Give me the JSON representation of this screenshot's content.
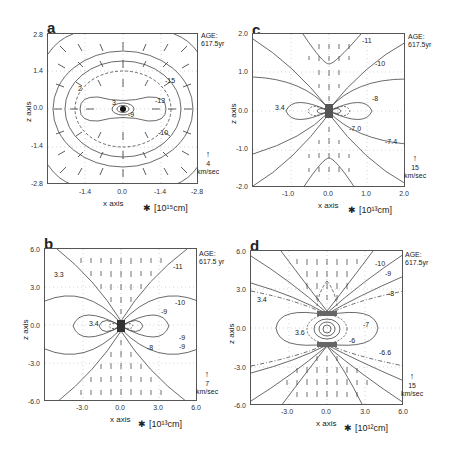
{
  "figure": {
    "panels": [
      {
        "id": "a",
        "letter": "a",
        "age_label": "AGE:",
        "age_value": "617.5yr",
        "y_axis_label": "z axis",
        "x_axis_label": "x axis",
        "unit_star": "✱",
        "unit": "[10¹⁵cm]",
        "y_ticks": [
          "2.8",
          "1.4",
          "0.0",
          "-1.4",
          "-2.8"
        ],
        "x_ticks": [
          "-1.4",
          "0.0",
          "-1.4",
          "-2.8"
        ],
        "velocity_scale_value": "4",
        "velocity_scale_unit": "km/sec",
        "contour_labels": [
          "-15",
          "-13",
          "-9",
          "-10",
          "2",
          "3"
        ]
      },
      {
        "id": "c",
        "letter": "c",
        "age_label": "AGE:",
        "age_value": "617.5yr",
        "y_axis_label": "z axis",
        "x_axis_label": "x axis",
        "unit_star": "✱",
        "unit": "[10¹³cm]",
        "y_ticks": [
          "2.0",
          "1.0",
          "0.0",
          "-1.0",
          "-2.0"
        ],
        "x_ticks": [
          "-1.0",
          "0.0",
          "1.0",
          "2.0"
        ],
        "velocity_scale_value": "15",
        "velocity_scale_unit": "km/sec",
        "contour_labels": [
          "-11",
          "-10",
          "3.4",
          "-8",
          "-7.0",
          "-7.4"
        ]
      },
      {
        "id": "b",
        "letter": "b",
        "age_label": "AGE:",
        "age_value": "617.5 yr",
        "y_axis_label": "z axis",
        "x_axis_label": "x axis",
        "unit_star": "✱",
        "unit": "[10¹³cm]",
        "y_ticks": [
          "6.0",
          "3.0",
          "0.0",
          "-3.0",
          "-6.0"
        ],
        "x_ticks": [
          "-3.0",
          "0.0",
          "3.0",
          "6.0"
        ],
        "velocity_scale_value": "7",
        "velocity_scale_unit": "km/sec",
        "contour_labels": [
          "-11",
          "3.3",
          "-10",
          "-9",
          "3.4",
          "-9",
          "-8",
          "-9"
        ]
      },
      {
        "id": "d",
        "letter": "d",
        "age_label": "AGE:",
        "age_value": "617.5yr",
        "y_axis_label": "z axis",
        "x_axis_label": "x axis",
        "unit_star": "✱",
        "unit": "[10¹²cm]",
        "y_ticks": [
          "6.0",
          "3.0",
          "0.0",
          "-3.0",
          "-6.0"
        ],
        "x_ticks": [
          "-3.0",
          "0.0",
          "3.0",
          "6.0"
        ],
        "velocity_scale_value": "15",
        "velocity_scale_unit": "km/sec",
        "contour_labels": [
          "-10",
          "-9",
          "-8",
          "3.4",
          "-7",
          "3.6",
          "-6",
          "-6.6"
        ]
      }
    ]
  }
}
